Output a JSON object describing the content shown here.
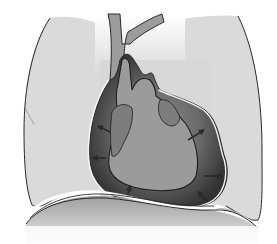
{
  "figure": {
    "title": "Pericardial effusion compressing the heart",
    "parts": [
      {
        "id": "left-lung",
        "label": "Lung"
      },
      {
        "id": "right-lung",
        "label": "Lung"
      },
      {
        "id": "great-vessels",
        "label": "Great vessels"
      },
      {
        "id": "pericardial-sac",
        "label": "Pericardial sac"
      },
      {
        "id": "pericardial-fluid",
        "label": "Pericardial fluid"
      },
      {
        "id": "heart",
        "label": "Heart"
      },
      {
        "id": "atria",
        "label": "Atria"
      },
      {
        "id": "diaphragm",
        "label": "Diaphragm"
      }
    ],
    "arrows": {
      "count": 8,
      "meaning": "fluid pressure pushing inward on heart"
    },
    "colors": {
      "background": "#ffffff",
      "lung": "#d9d9d9",
      "outline": "#2a2a2a",
      "heart": "#9a9a9a",
      "atria": "#7d7d7d",
      "fluid_dark": "#3a3a3a",
      "fluid_light": "#8a8a8a",
      "diaphragm": "#a8a8a8",
      "sac_line": "#f2f2f2"
    }
  }
}
